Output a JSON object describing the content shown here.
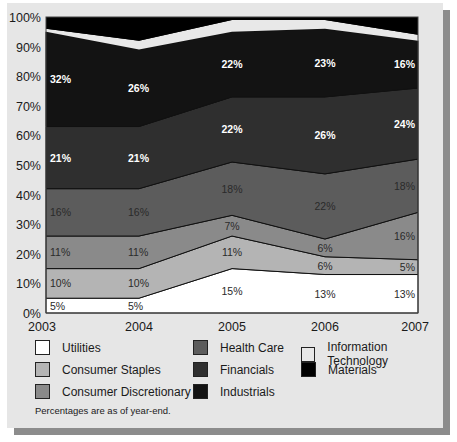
{
  "chart_data": {
    "type": "area",
    "stacked": true,
    "title": "",
    "xlabel": "",
    "ylabel": "",
    "ylim": [
      0,
      100
    ],
    "y_ticks": [
      "0%",
      "10%",
      "20%",
      "30%",
      "40%",
      "50%",
      "60%",
      "70%",
      "80%",
      "90%",
      "100%"
    ],
    "categories": [
      "2003",
      "2004",
      "2005",
      "2006",
      "2007"
    ],
    "series": [
      {
        "name": "Utilities",
        "color": "#ffffff",
        "values": [
          5,
          5,
          15,
          13,
          13
        ],
        "labels": [
          "5%",
          "5%",
          "15%",
          "13%",
          "13%"
        ]
      },
      {
        "name": "Consumer Staples",
        "color": "#b4b4b4",
        "values": [
          10,
          10,
          11,
          6,
          5
        ],
        "labels": [
          "10%",
          "10%",
          "11%",
          "6%",
          "5%"
        ]
      },
      {
        "name": "Consumer Discretionary",
        "color": "#8a8a8a",
        "values": [
          11,
          11,
          7,
          6,
          16
        ],
        "labels": [
          "11%",
          "11%",
          "7%",
          "6%",
          "16%"
        ]
      },
      {
        "name": "Health Care",
        "color": "#5c5c5c",
        "values": [
          16,
          16,
          18,
          22,
          18
        ],
        "labels": [
          "16%",
          "16%",
          "18%",
          "22%",
          "18%"
        ]
      },
      {
        "name": "Financials",
        "color": "#2f2f2f",
        "values": [
          21,
          21,
          22,
          26,
          24
        ],
        "labels": [
          "21%",
          "21%",
          "22%",
          "26%",
          "24%"
        ]
      },
      {
        "name": "Industrials",
        "color": "#131313",
        "values": [
          32,
          26,
          22,
          23,
          16
        ],
        "labels": [
          "32%",
          "26%",
          "22%",
          "23%",
          "16%"
        ]
      },
      {
        "name": "Information Technology",
        "color": "#e8e8e8",
        "values": [
          1,
          3,
          4,
          3,
          2
        ]
      },
      {
        "name": "Materials",
        "color": "#000000",
        "values": [
          4,
          8,
          1,
          2,
          6
        ]
      }
    ],
    "grid": false,
    "legend_position": "bottom",
    "annotations": [
      "Percentages are as of year-end."
    ]
  },
  "legend": {
    "items": [
      {
        "label": "Utilities",
        "color": "#ffffff"
      },
      {
        "label": "Consumer Staples",
        "color": "#b4b4b4"
      },
      {
        "label": "Consumer Discretionary",
        "color": "#8a8a8a"
      },
      {
        "label": "Health Care",
        "color": "#5c5c5c"
      },
      {
        "label": "Financials",
        "color": "#2f2f2f"
      },
      {
        "label": "Industrials",
        "color": "#131313"
      },
      {
        "label": "Information Technology",
        "color": "#e8e8e8"
      },
      {
        "label": "Materials",
        "color": "#000000"
      }
    ]
  },
  "footnote": "Percentages are as of year-end."
}
